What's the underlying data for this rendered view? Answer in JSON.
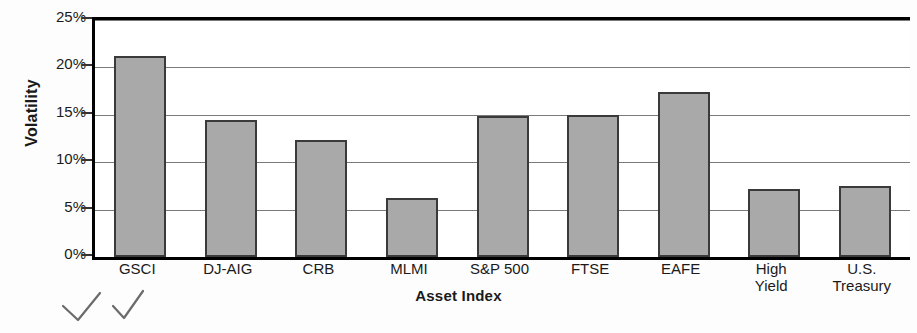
{
  "chart_data": {
    "type": "bar",
    "title": "",
    "xlabel": "Asset Index",
    "ylabel": "Volatility",
    "categories": [
      "GSCI",
      "DJ-AIG",
      "CRB",
      "MLMI",
      "S&P 500",
      "FTSE",
      "EAFE",
      "High\nYield",
      "U.S.\nTreasury"
    ],
    "values": [
      21.2,
      14.5,
      12.3,
      6.2,
      14.9,
      15.0,
      17.4,
      7.2,
      7.5
    ],
    "ylim": [
      0,
      25
    ],
    "ytick_values": [
      0,
      5,
      10,
      15,
      20,
      25
    ],
    "ytick_labels": [
      "0%",
      "5%",
      "10%",
      "15%",
      "20%",
      "25%"
    ],
    "grid": true,
    "legend": false,
    "bar_color": "#a9a9a9",
    "bar_border_color": "#3a3a3a",
    "axis_color": "#000000",
    "gridline_color": "#7a7a7a"
  },
  "annotations": {
    "marks": [
      {
        "name": "handwritten-check-1"
      },
      {
        "name": "handwritten-check-2"
      }
    ]
  }
}
